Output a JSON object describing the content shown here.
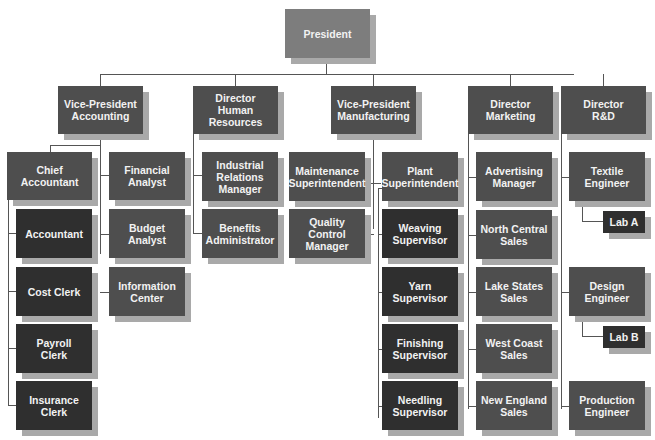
{
  "chart": {
    "root": {
      "id": "president",
      "label": "President"
    },
    "level1": [
      {
        "id": "vp-accounting",
        "label": "Vice-President\nAccounting"
      },
      {
        "id": "dir-hr",
        "label": "Director\nHuman\nResources"
      },
      {
        "id": "vp-manufacturing",
        "label": "Vice-President\nManufacturing"
      },
      {
        "id": "dir-marketing",
        "label": "Director\nMarketing"
      },
      {
        "id": "dir-rd",
        "label": "Director\nR&D"
      }
    ],
    "accounting": {
      "chief_accountant": "Chief\nAccountant",
      "chief_reports": [
        "Accountant",
        "Cost Clerk",
        "Payroll\nClerk",
        "Insurance\nClerk"
      ],
      "staff": [
        "Financial\nAnalyst",
        "Budget\nAnalyst",
        "Information\nCenter"
      ]
    },
    "hr": [
      "Industrial\nRelations\nManager",
      "Benefits\nAdministrator"
    ],
    "manufacturing": {
      "staff": [
        "Maintenance\nSuperintendent",
        "Quality\nControl\nManager"
      ],
      "plant_superintendent": "Plant\nSuperintendent",
      "supervisors": [
        "Weaving\nSupervisor",
        "Yarn\nSupervisor",
        "Finishing\nSupervisor",
        "Needling\nSupervisor"
      ]
    },
    "marketing": [
      "Advertising\nManager",
      "North Central\nSales",
      "Lake States\nSales",
      "West Coast\nSales",
      "New England\nSales"
    ],
    "rd": {
      "textile_engineer": "Textile\nEngineer",
      "lab_a": "Lab A",
      "design_engineer": "Design\nEngineer",
      "lab_b": "Lab B",
      "production_engineer": "Production\nEngineer"
    }
  },
  "colors": {
    "top": "#7d7d7d",
    "mid": "#4e4e4e",
    "dark": "#2f2f2f",
    "shadow": "#a9a9a9",
    "line": "#555555"
  }
}
